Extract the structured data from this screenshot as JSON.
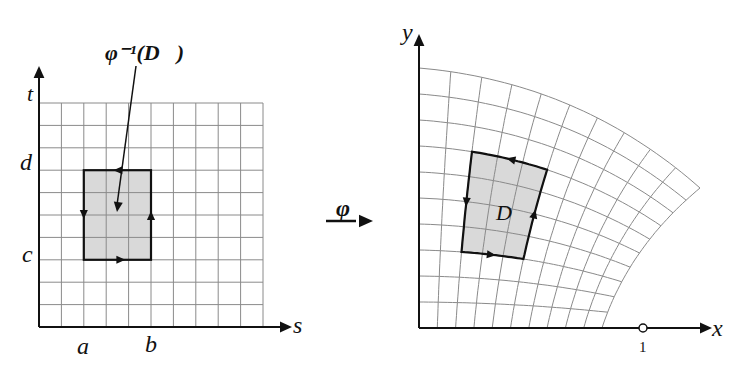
{
  "left_panel": {
    "axis_x_label": "s",
    "axis_y_label": "t",
    "tick_a": "a",
    "tick_b": "b",
    "tick_c": "c",
    "tick_d": "d",
    "region_label": "φ⁻¹(D⃗)",
    "grid": {
      "x0": 39,
      "y0": 327,
      "cell": 22.4,
      "cols": 10,
      "rows": 10
    },
    "rect": {
      "col0": 2,
      "col1": 5,
      "row0": 3,
      "row1": 7
    }
  },
  "mapping": {
    "label": "φ"
  },
  "right_panel": {
    "axis_x_label": "x",
    "axis_y_label": "y",
    "tick_one": "1",
    "region_label": "D⃗",
    "grid_rows": 10,
    "grid_cols": 10
  },
  "colors": {
    "grid": "#8a8a8a",
    "axis": "#111111",
    "region_fill": "#d9d9d9",
    "region_stroke": "#111111"
  }
}
